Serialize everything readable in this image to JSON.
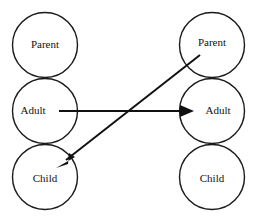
{
  "diagram": {
    "background_color": "#ffffff",
    "stroke_color": "#1a1a1a",
    "line_color": "#111111",
    "text_color": "#111111",
    "columns": [
      {
        "name": "left-person",
        "center_x": 45,
        "states": [
          {
            "label": "Parent",
            "cx": 45,
            "cy": 45,
            "r": 32.5,
            "label_x": 45,
            "label_y": 45
          },
          {
            "label": "Adult",
            "cx": 45,
            "cy": 111,
            "r": 32.5,
            "label_x": 33,
            "label_y": 111
          },
          {
            "label": "Child",
            "cx": 45,
            "cy": 177,
            "r": 32.5,
            "label_x": 45,
            "label_y": 179
          }
        ]
      },
      {
        "name": "right-person",
        "center_x": 212,
        "states": [
          {
            "label": "Parent",
            "cx": 212,
            "cy": 45,
            "r": 32.5,
            "label_x": 212,
            "label_y": 43
          },
          {
            "label": "Adult",
            "cx": 212,
            "cy": 111,
            "r": 32.5,
            "label_x": 218,
            "label_y": 111
          },
          {
            "label": "Child",
            "cx": 212,
            "cy": 177,
            "r": 32.5,
            "label_x": 212,
            "label_y": 179
          }
        ]
      }
    ],
    "transactions": [
      {
        "name": "adult-to-adult-stimulus",
        "from": "left-adult",
        "to": "right-adult",
        "x1": 59,
        "y1": 111,
        "x2": 192,
        "y2": 111,
        "arrowhead": true
      },
      {
        "name": "parent-to-child-response",
        "from": "right-parent",
        "to": "left-child",
        "x1": 200,
        "y1": 55,
        "x2": 58,
        "y2": 166,
        "arrowhead": true
      }
    ]
  }
}
